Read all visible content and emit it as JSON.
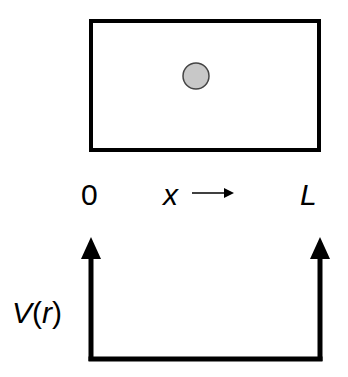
{
  "diagram": {
    "type": "particle-in-a-box",
    "box": {
      "x": 89,
      "y": 19,
      "width": 232,
      "height": 133,
      "stroke": "#000000",
      "stroke_width": 4
    },
    "particle": {
      "cx": 196,
      "cy": 76,
      "r": 13,
      "fill": "#c8c8c8",
      "stroke": "#444444"
    },
    "axis_labels": {
      "origin": "0",
      "x_var": "x",
      "end": "L"
    },
    "potential": {
      "label_V": "V",
      "label_open": "(",
      "label_r": "r",
      "label_close": ")",
      "left_wall_x": 91,
      "right_wall_x": 320,
      "floor_y": 359,
      "arrow_tip_y": 237
    },
    "colors": {
      "line": "#000000",
      "particle_fill": "#c8c8c8",
      "background": "#ffffff"
    }
  }
}
